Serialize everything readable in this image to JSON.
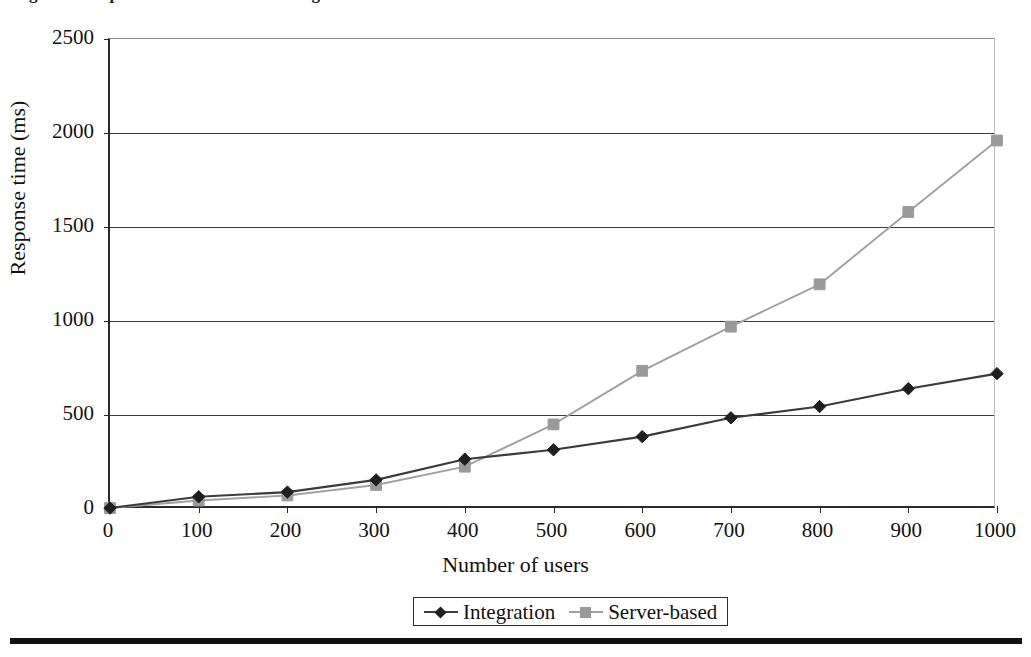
{
  "caption": {
    "text": "Figure 5.  Response times under increasing load"
  },
  "chart_data": {
    "type": "line",
    "title": "",
    "xlabel": "Number of users",
    "ylabel": "Response time (ms)",
    "x": [
      0,
      100,
      200,
      300,
      400,
      500,
      600,
      700,
      800,
      900,
      1000
    ],
    "xlim": [
      0,
      1000
    ],
    "ylim": [
      0,
      2500
    ],
    "xticks": [
      "0",
      "100",
      "200",
      "300",
      "400",
      "500",
      "600",
      "700",
      "800",
      "900",
      "1000"
    ],
    "yticks": [
      "0",
      "500",
      "1000",
      "1500",
      "2000",
      "2500"
    ],
    "grid": "horizontal",
    "legend_position": "bottom-center",
    "series": [
      {
        "name": "Integration",
        "color": "#3b3b3b",
        "marker": "diamond",
        "marker_color": "#1f1f1f",
        "values": [
          5,
          65,
          90,
          155,
          265,
          315,
          385,
          485,
          545,
          640,
          720
        ]
      },
      {
        "name": "Server-based",
        "color": "#a0a0a0",
        "marker": "square",
        "marker_color": "#9a9a9a",
        "values": [
          5,
          45,
          72,
          128,
          225,
          450,
          735,
          970,
          1195,
          1580,
          1960
        ]
      }
    ]
  },
  "axes": {
    "y_tick_labels": [
      "2500",
      "2000",
      "1500",
      "1000",
      "500",
      "0"
    ],
    "x_tick_labels": [
      "0",
      "100",
      "200",
      "300",
      "400",
      "500",
      "600",
      "700",
      "800",
      "900",
      "1000"
    ],
    "y_title": "Response time (ms)",
    "x_title": "Number of users"
  },
  "legend": {
    "entries": [
      {
        "label": "Integration"
      },
      {
        "label": "Server-based"
      }
    ]
  }
}
